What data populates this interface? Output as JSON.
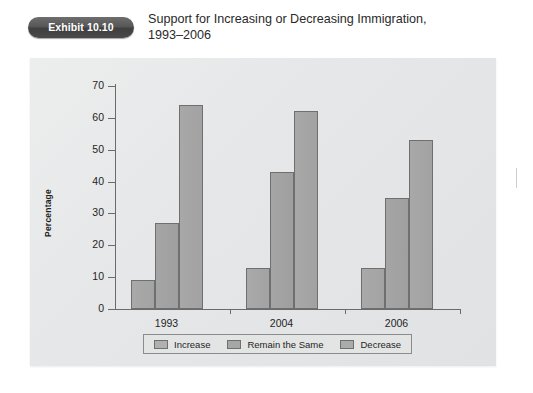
{
  "exhibit": {
    "badge_label": "Exhibit 10.10",
    "title": "Support for Increasing or Decreasing Immigration,\n1993–2006"
  },
  "chart_data": {
    "type": "bar",
    "title": "Support for Increasing or Decreasing Immigration, 1993–2006",
    "xlabel": "",
    "ylabel": "Percentage",
    "categories": [
      "1993",
      "2004",
      "2006"
    ],
    "series": [
      {
        "name": "Increase",
        "values": [
          9,
          13,
          13
        ],
        "color": "#a9a9a9"
      },
      {
        "name": "Remain the Same",
        "values": [
          27,
          43,
          35
        ],
        "color": "#a5a5a5"
      },
      {
        "name": "Decrease",
        "values": [
          64,
          62,
          53
        ],
        "color": "#a8a8a8"
      }
    ],
    "ylim": [
      0,
      70
    ],
    "yticks": [
      0,
      10,
      20,
      30,
      40,
      50,
      60,
      70
    ],
    "ytick_labels": [
      "0",
      "10",
      "20",
      "30",
      "40",
      "50",
      "60",
      "70"
    ],
    "grid": false,
    "legend_position": "bottom"
  },
  "axes": {
    "y_title": "Percentage"
  }
}
